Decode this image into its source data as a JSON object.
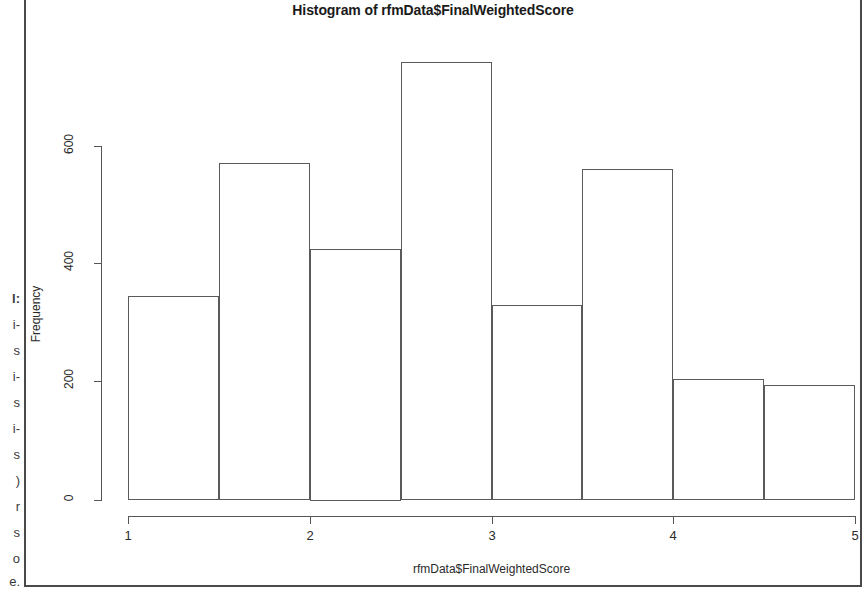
{
  "figure": {
    "title": "Histogram of rfmData$FinalWeightedScore",
    "xlabel": "rfmData$FinalWeightedScore",
    "ylabel": "Frequency"
  },
  "gutter": {
    "lines": [
      "l:",
      "i-",
      "s",
      "i-",
      "s",
      "i-",
      "s",
      ")",
      "r",
      "s",
      "o",
      "e."
    ]
  },
  "chart_data": {
    "type": "bar",
    "title": "Histogram of rfmData$FinalWeightedScore",
    "xlabel": "rfmData$FinalWeightedScore",
    "ylabel": "Frequency",
    "xlim": [
      1,
      5
    ],
    "ylim": [
      0,
      760
    ],
    "grid": false,
    "legend": null,
    "bin_width": 0.5,
    "bin_edges": [
      1.0,
      1.5,
      2.0,
      2.5,
      3.0,
      3.5,
      4.0,
      4.5,
      5.0
    ],
    "categories": [
      "1.0-1.5",
      "1.5-2.0",
      "2.0-2.5",
      "2.5-3.0",
      "3.0-3.5",
      "3.5-4.0",
      "4.0-4.5",
      "4.5-5.0"
    ],
    "values": [
      345,
      570,
      425,
      740,
      330,
      560,
      205,
      195
    ],
    "xticks": [
      "1",
      "2",
      "3",
      "4",
      "5"
    ],
    "xtick_values": [
      1,
      2,
      3,
      4,
      5
    ],
    "yticks": [
      "0",
      "200",
      "400",
      "600"
    ],
    "ytick_values": [
      0,
      200,
      400,
      600
    ]
  }
}
